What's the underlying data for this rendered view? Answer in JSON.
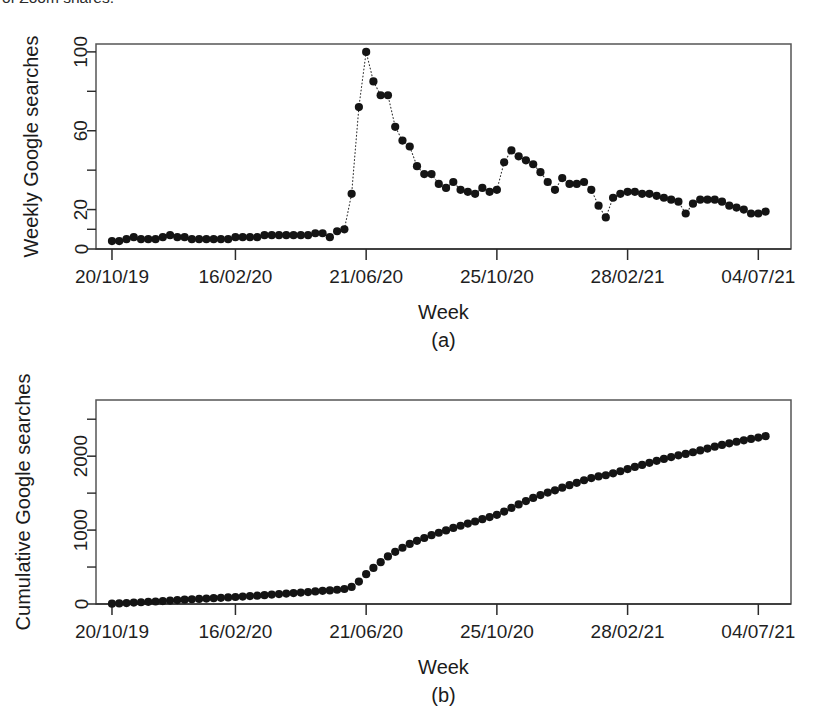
{
  "page": {
    "clipped_caption_tail": "of Zoom shares."
  },
  "figure": {
    "panels": [
      {
        "id": "a",
        "caption": "(a)"
      },
      {
        "id": "b",
        "caption": "(b)"
      }
    ]
  },
  "chart_data": [
    {
      "type": "scatter",
      "panel": "a",
      "title": "",
      "xlabel": "Week",
      "ylabel": "Weekly Google searches",
      "grid": false,
      "legend": null,
      "xtick_labels": [
        "20/10/19",
        "16/02/20",
        "21/06/20",
        "25/10/20",
        "28/02/21",
        "04/07/21"
      ],
      "xtick_indices": [
        0,
        17,
        35,
        53,
        71,
        89
      ],
      "ytick_labels": [
        "0",
        "20",
        "60",
        "100"
      ],
      "ytick_values": [
        0,
        20,
        60,
        100
      ],
      "yminor_values": [
        10,
        40,
        80
      ],
      "ylim": [
        0,
        104
      ],
      "xlim": [
        -2.2,
        93.5
      ],
      "marker": "filled-circle",
      "connector": "dotted",
      "x": [
        0,
        1,
        2,
        3,
        4,
        5,
        6,
        7,
        8,
        9,
        10,
        11,
        12,
        13,
        14,
        15,
        16,
        17,
        18,
        19,
        20,
        21,
        22,
        23,
        24,
        25,
        26,
        27,
        28,
        29,
        30,
        31,
        32,
        33,
        34,
        35,
        36,
        37,
        38,
        39,
        40,
        41,
        42,
        43,
        44,
        45,
        46,
        47,
        48,
        49,
        50,
        51,
        52,
        53,
        54,
        55,
        56,
        57,
        58,
        59,
        60,
        61,
        62,
        63,
        64,
        65,
        66,
        67,
        68,
        69,
        70,
        71,
        72,
        73,
        74,
        75,
        76,
        77,
        78,
        79,
        80,
        81,
        82,
        83,
        84,
        85,
        86,
        87,
        88,
        89,
        90
      ],
      "values": [
        4,
        4,
        5,
        6,
        5,
        5,
        5,
        6,
        7,
        6,
        6,
        5,
        5,
        5,
        5,
        5,
        5,
        6,
        6,
        6,
        6,
        7,
        7,
        7,
        7,
        7,
        7,
        7,
        8,
        8,
        6,
        9,
        10,
        28,
        72,
        100,
        85,
        78,
        78,
        62,
        55,
        52,
        42,
        38,
        38,
        33,
        31,
        34,
        30,
        29,
        28,
        31,
        29,
        30,
        44,
        50,
        47,
        45,
        43,
        39,
        34,
        30,
        36,
        33,
        33,
        34,
        30,
        22,
        16,
        26,
        28,
        29,
        29,
        28,
        28,
        27,
        26,
        25,
        24,
        18,
        23,
        25,
        25,
        25,
        24,
        22,
        21,
        20,
        18,
        18,
        19
      ],
      "notes": "Weekly Google search interest index (0-100); sharp spike to 100 in March 2020, secondary bump near 50 in late August 2020, settling near 20 by mid-2021."
    },
    {
      "type": "scatter",
      "panel": "b",
      "title": "",
      "xlabel": "Week",
      "ylabel": "Cumulative Google searches",
      "grid": false,
      "legend": null,
      "xtick_labels": [
        "20/10/19",
        "16/02/20",
        "21/06/20",
        "25/10/20",
        "28/02/21",
        "04/07/21"
      ],
      "xtick_indices": [
        0,
        17,
        35,
        53,
        71,
        89
      ],
      "ytick_labels": [
        "0",
        "1000",
        "2000"
      ],
      "ytick_values": [
        0,
        1000,
        2000
      ],
      "yminor_values": [
        500,
        1500,
        2500
      ],
      "ylim": [
        0,
        2760
      ],
      "xlim": [
        -2.2,
        93.5
      ],
      "marker": "filled-circle",
      "connector": "none",
      "x": [
        0,
        1,
        2,
        3,
        4,
        5,
        6,
        7,
        8,
        9,
        10,
        11,
        12,
        13,
        14,
        15,
        16,
        17,
        18,
        19,
        20,
        21,
        22,
        23,
        24,
        25,
        26,
        27,
        28,
        29,
        30,
        31,
        32,
        33,
        34,
        35,
        36,
        37,
        38,
        39,
        40,
        41,
        42,
        43,
        44,
        45,
        46,
        47,
        48,
        49,
        50,
        51,
        52,
        53,
        54,
        55,
        56,
        57,
        58,
        59,
        60,
        61,
        62,
        63,
        64,
        65,
        66,
        67,
        68,
        69,
        70,
        71,
        72,
        73,
        74,
        75,
        76,
        77,
        78,
        79,
        80,
        81,
        82,
        83,
        84,
        85,
        86,
        87,
        88,
        89,
        90
      ],
      "values": [
        4,
        8,
        13,
        19,
        24,
        29,
        34,
        40,
        47,
        53,
        59,
        64,
        69,
        74,
        79,
        84,
        89,
        95,
        101,
        107,
        113,
        120,
        127,
        134,
        141,
        148,
        155,
        162,
        170,
        178,
        184,
        193,
        203,
        231,
        303,
        403,
        488,
        566,
        644,
        706,
        761,
        813,
        855,
        893,
        931,
        964,
        995,
        1029,
        1059,
        1088,
        1116,
        1147,
        1176,
        1206,
        1250,
        1300,
        1347,
        1392,
        1435,
        1474,
        1508,
        1538,
        1574,
        1607,
        1640,
        1674,
        1704,
        1726,
        1742,
        1768,
        1796,
        1825,
        1854,
        1882,
        1910,
        1937,
        1963,
        1988,
        2012,
        2030,
        2053,
        2078,
        2103,
        2128,
        2152,
        2174,
        2195,
        2215,
        2233,
        2251,
        2270
      ],
      "notes": "Running total of the weekly Google search index; flat near zero before March 2020, steep rise through mid-2020, then steady near-linear growth to about 2700 by July 2021."
    }
  ]
}
